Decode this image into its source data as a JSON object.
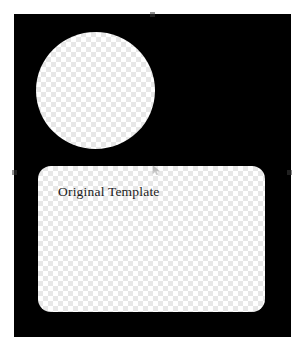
{
  "app": {
    "canvas_background": "#000000",
    "page_background": "#ffffff"
  },
  "canvas": {
    "name": "artboard",
    "shapes": [
      {
        "id": "circle",
        "type": "ellipse",
        "fill": "transparent-checkerboard",
        "label": ""
      },
      {
        "id": "rounded-rect",
        "type": "rounded-rectangle",
        "fill": "transparent-checkerboard",
        "label": "Original Template"
      }
    ],
    "label_text": "Original Template",
    "label_color": "#1b1b1b"
  },
  "selection": {
    "active": true,
    "handle_color": "#3a3a3a",
    "handles": [
      {
        "name": "top-center",
        "position": "top"
      },
      {
        "name": "middle-left",
        "position": "left"
      },
      {
        "name": "middle-right",
        "position": "right"
      }
    ]
  },
  "cursor": {
    "name": "pointer-arrow",
    "visible": true
  },
  "palette": {
    "checker_light": "#ffffff",
    "checker_dark": "#e7e7e7",
    "artboard": "#000000",
    "text": "#1b1b1b"
  }
}
